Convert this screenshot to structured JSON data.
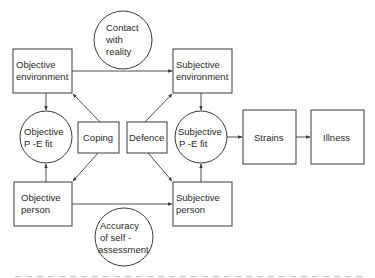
{
  "diagram": {
    "nodes": {
      "obj_env": {
        "line1": "Objective",
        "line2": "environment"
      },
      "subj_env": {
        "line1": "Subjective",
        "line2": "environment"
      },
      "contact": {
        "line1": "Contact",
        "line2": "with",
        "line3": "reality"
      },
      "obj_pe": {
        "line1": "Objective",
        "line2": "P -E fit"
      },
      "coping": {
        "label": "Coping"
      },
      "defence": {
        "label": "Defence"
      },
      "subj_pe": {
        "line1": "Subjective",
        "line2": "P -E fit"
      },
      "strains": {
        "label": "Strains"
      },
      "illness": {
        "label": "Illness"
      },
      "obj_person": {
        "line1": "Objective",
        "line2": "person"
      },
      "subj_person": {
        "line1": "Subjective",
        "line2": "person"
      },
      "accuracy": {
        "line1": "Accuracy",
        "line2": "of self -",
        "line3": "assessment"
      }
    },
    "edges": [
      {
        "from": "Objective environment",
        "to": "Subjective environment"
      },
      {
        "from": "Objective environment",
        "to": "Objective P-E fit"
      },
      {
        "from": "Objective person",
        "to": "Objective P-E fit"
      },
      {
        "from": "Coping",
        "to": "Objective environment"
      },
      {
        "from": "Coping",
        "to": "Objective person"
      },
      {
        "from": "Defence",
        "to": "Subjective environment"
      },
      {
        "from": "Defence",
        "to": "Subjective person"
      },
      {
        "from": "Subjective environment",
        "to": "Subjective P-E fit"
      },
      {
        "from": "Subjective person",
        "to": "Subjective P-E fit"
      },
      {
        "from": "Subjective P-E fit",
        "to": "Strains"
      },
      {
        "from": "Strains",
        "to": "Illness"
      },
      {
        "from": "Objective person",
        "to": "Subjective person"
      }
    ]
  }
}
